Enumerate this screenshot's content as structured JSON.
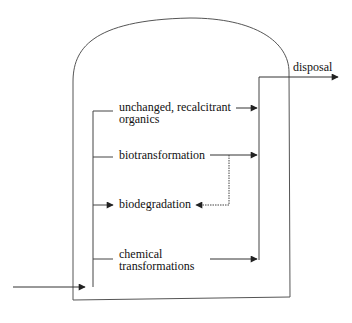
{
  "diagram": {
    "colors": {
      "line": "#333333",
      "text": "#111111",
      "background": "#ffffff"
    },
    "labels": {
      "unchanged_line1": "unchanged, recalcitrant",
      "unchanged_line2": "organics",
      "biotransformation": "biotransformation",
      "biodegradation": "biodegradation",
      "chemical_line1": "chemical",
      "chemical_line2": "transformations",
      "disposal": "disposal"
    },
    "nodes": [
      {
        "id": "unchanged",
        "label": "unchanged, recalcitrant organics"
      },
      {
        "id": "biotransformation",
        "label": "biotransformation"
      },
      {
        "id": "biodegradation",
        "label": "biodegradation"
      },
      {
        "id": "chemical",
        "label": "chemical transformations"
      },
      {
        "id": "disposal",
        "label": "disposal"
      }
    ],
    "edges": [
      {
        "from": "influent",
        "to": "distribution",
        "style": "solid"
      },
      {
        "from": "distribution",
        "to": "unchanged",
        "style": "solid"
      },
      {
        "from": "distribution",
        "to": "biotransformation",
        "style": "solid"
      },
      {
        "from": "distribution",
        "to": "biodegradation",
        "style": "solid"
      },
      {
        "from": "distribution",
        "to": "chemical",
        "style": "solid"
      },
      {
        "from": "unchanged",
        "to": "collector",
        "style": "solid"
      },
      {
        "from": "biotransformation",
        "to": "collector",
        "style": "solid"
      },
      {
        "from": "biotransformation",
        "to": "biodegradation",
        "style": "dotted"
      },
      {
        "from": "chemical",
        "to": "collector",
        "style": "solid"
      },
      {
        "from": "collector",
        "to": "disposal",
        "style": "solid"
      }
    ]
  }
}
